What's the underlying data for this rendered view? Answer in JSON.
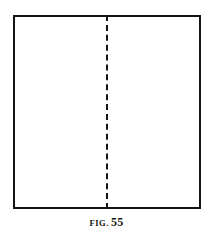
{
  "figure": {
    "kind": "line-diagram",
    "caption": {
      "label": "FIG.",
      "number": "55",
      "full_text": "FIG. 55"
    },
    "colors": {
      "ink": "#141414",
      "paper": "#ffffff"
    },
    "shapes": {
      "outline": {
        "name": "square-sheet-outline",
        "stroke_width_px": 2
      },
      "fold_line": {
        "name": "vertical-fold-line",
        "style": "dashed",
        "stroke_width_px": 2,
        "dash_px": 8,
        "gap_px": 4,
        "position": "center"
      }
    }
  }
}
